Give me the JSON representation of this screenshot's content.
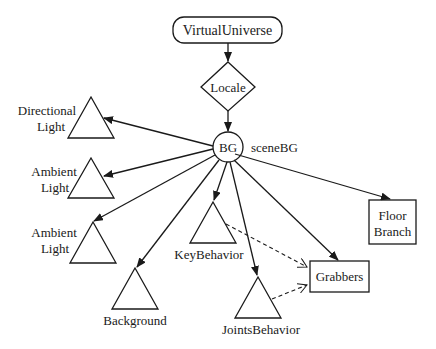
{
  "diagram": {
    "nodes": {
      "virtual_universe": {
        "label": "VirtualUniverse",
        "shape": "rounded-rect"
      },
      "locale": {
        "label": "Locale",
        "shape": "diamond"
      },
      "bg": {
        "label": "BG",
        "shape": "circle",
        "annotation": "sceneBG"
      },
      "directional_light": {
        "label_line1": "Directional",
        "label_line2": "Light",
        "shape": "triangle"
      },
      "ambient_light_1": {
        "label_line1": "Ambient",
        "label_line2": "Light",
        "shape": "triangle"
      },
      "ambient_light_2": {
        "label_line1": "Ambient",
        "label_line2": "Light",
        "shape": "triangle"
      },
      "background": {
        "label": "Background",
        "shape": "triangle"
      },
      "key_behavior": {
        "label": "KeyBehavior",
        "shape": "triangle"
      },
      "joints_behavior": {
        "label": "JointsBehavior",
        "shape": "triangle"
      },
      "grabbers": {
        "label": "Grabbers",
        "shape": "rect"
      },
      "floor_branch": {
        "label_line1": "Floor",
        "label_line2": "Branch",
        "shape": "rect"
      }
    },
    "edges": [
      {
        "from": "VirtualUniverse",
        "to": "Locale",
        "style": "solid"
      },
      {
        "from": "Locale",
        "to": "BG",
        "style": "solid"
      },
      {
        "from": "BG",
        "to": "Directional Light",
        "style": "solid"
      },
      {
        "from": "BG",
        "to": "Ambient Light",
        "style": "solid"
      },
      {
        "from": "BG",
        "to": "Ambient Light",
        "style": "solid"
      },
      {
        "from": "BG",
        "to": "Background",
        "style": "solid"
      },
      {
        "from": "BG",
        "to": "KeyBehavior",
        "style": "solid"
      },
      {
        "from": "BG",
        "to": "JointsBehavior",
        "style": "solid"
      },
      {
        "from": "BG",
        "to": "Grabbers",
        "style": "solid"
      },
      {
        "from": "BG",
        "to": "Floor Branch",
        "style": "solid"
      },
      {
        "from": "KeyBehavior",
        "to": "Grabbers",
        "style": "dashed"
      },
      {
        "from": "JointsBehavior",
        "to": "Grabbers",
        "style": "dashed"
      }
    ],
    "colors": {
      "stroke": "#1a1a1a",
      "background": "#ffffff"
    }
  }
}
